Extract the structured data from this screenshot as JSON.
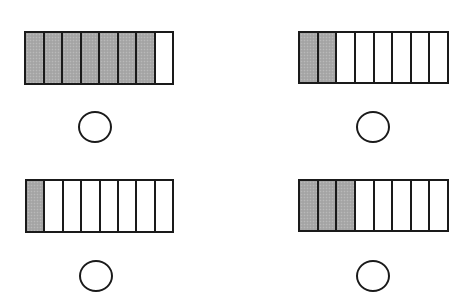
{
  "figure": {
    "colors": {
      "shaded": "#a9a9a9",
      "unshaded": "#ffffff",
      "outline": "#1a1a1a",
      "background": "#ffffff"
    },
    "panels": [
      {
        "id": "top-left",
        "parts_total": 8,
        "parts_shaded": 7,
        "bar": {
          "x": 24,
          "y": 31,
          "w": 150,
          "h": 54
        },
        "circle": {
          "cx": 95,
          "cy": 127,
          "rx": 17,
          "ry": 16
        },
        "answer": ""
      },
      {
        "id": "top-right",
        "parts_total": 8,
        "parts_shaded": 2,
        "bar": {
          "x": 298,
          "y": 31,
          "w": 151,
          "h": 53
        },
        "circle": {
          "cx": 373,
          "cy": 127,
          "rx": 17,
          "ry": 16
        },
        "answer": ""
      },
      {
        "id": "bottom-left",
        "parts_total": 8,
        "parts_shaded": 1,
        "bar": {
          "x": 25,
          "y": 179,
          "w": 149,
          "h": 54
        },
        "circle": {
          "cx": 96,
          "cy": 276,
          "rx": 17,
          "ry": 16
        },
        "answer": ""
      },
      {
        "id": "bottom-right",
        "parts_total": 8,
        "parts_shaded": 3,
        "bar": {
          "x": 298,
          "y": 179,
          "w": 151,
          "h": 53
        },
        "circle": {
          "cx": 373,
          "cy": 276,
          "rx": 17,
          "ry": 16
        },
        "answer": ""
      }
    ]
  }
}
